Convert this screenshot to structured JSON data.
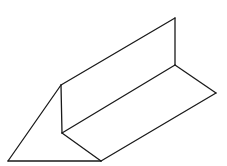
{
  "figure": {
    "width": 227,
    "height": 166,
    "background": "#ffffff",
    "stroke_color": "#1a1a1a",
    "stroke_width": 1.3,
    "vertices": {
      "A": [
        61,
        85
      ],
      "B": [
        62,
        133
      ],
      "C": [
        8,
        161
      ],
      "D": [
        101,
        161
      ],
      "E": [
        175,
        18
      ],
      "F": [
        175,
        65
      ],
      "G": [
        216,
        93
      ]
    },
    "edges": [
      {
        "name": "left-vertical-edge",
        "from": "A",
        "to": "B"
      },
      {
        "name": "end-face-slant-edge",
        "from": "A",
        "to": "C"
      },
      {
        "name": "end-face-bottom-edge",
        "from": "C",
        "to": "D"
      },
      {
        "name": "end-face-inner-edge",
        "from": "B",
        "to": "D"
      },
      {
        "name": "top-long-edge",
        "from": "A",
        "to": "E"
      },
      {
        "name": "right-vertical-edge",
        "from": "E",
        "to": "F"
      },
      {
        "name": "fold-long-edge",
        "from": "B",
        "to": "F"
      },
      {
        "name": "far-base-edge",
        "from": "F",
        "to": "G"
      },
      {
        "name": "front-long-edge",
        "from": "D",
        "to": "G"
      }
    ]
  }
}
